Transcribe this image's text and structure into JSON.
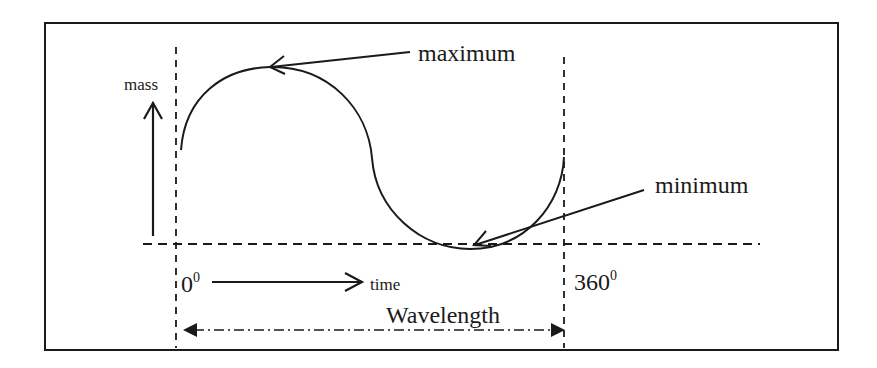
{
  "diagram": {
    "labels": {
      "y_axis": "mass",
      "x_axis": "time",
      "max": "maximum",
      "min": "minimum",
      "start_angle": "0",
      "start_angle_sup": "0",
      "end_angle": "360",
      "end_angle_sup": "0",
      "wavelength": "Wavelength"
    },
    "colors": {
      "stroke": "#1a1a1a",
      "background": "#ffffff"
    }
  }
}
